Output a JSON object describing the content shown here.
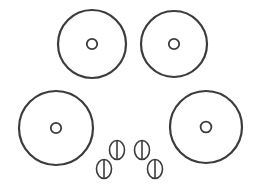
{
  "canvas": {
    "width": 258,
    "height": 196,
    "background_color": "#ffffff"
  },
  "style": {
    "stroke_color": "#3c3c3c",
    "ring_stroke_width": 2.2,
    "hole_stroke_width": 1.8,
    "screw_stroke_width": 1.6,
    "fill_color": "#ffffff"
  },
  "diagram": {
    "part_count": 8
  },
  "rings": [
    {
      "name": "washer-top-left",
      "label": "Washer 1",
      "cx": 92,
      "cy": 44,
      "r": 34,
      "hole_r": 5.2
    },
    {
      "name": "washer-top-right",
      "label": "Washer 2",
      "cx": 174,
      "cy": 44,
      "r": 33,
      "hole_r": 5.2
    },
    {
      "name": "washer-bottom-left",
      "label": "Washer 3",
      "cx": 56,
      "cy": 128,
      "r": 37,
      "hole_r": 5.2
    },
    {
      "name": "washer-bottom-right",
      "label": "Washer 4",
      "cx": 206,
      "cy": 127,
      "r": 36,
      "hole_r": 5.4
    }
  ],
  "screws": [
    {
      "name": "screw-upper-left",
      "label": "Fastener A",
      "cx": 117,
      "cy": 150,
      "rx": 7.5,
      "ry": 9.5
    },
    {
      "name": "screw-upper-right",
      "label": "Fastener B",
      "cx": 142,
      "cy": 150,
      "rx": 7.5,
      "ry": 9.5
    },
    {
      "name": "screw-lower-left",
      "label": "Fastener C",
      "cx": 104,
      "cy": 169,
      "rx": 7.5,
      "ry": 9.5
    },
    {
      "name": "screw-lower-right",
      "label": "Fastener D",
      "cx": 155,
      "cy": 169,
      "rx": 7.5,
      "ry": 9.5
    }
  ]
}
